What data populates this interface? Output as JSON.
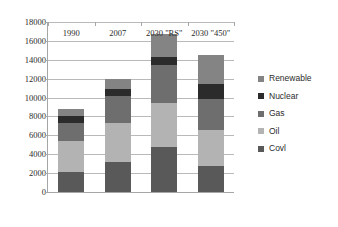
{
  "chart_data": {
    "type": "bar",
    "stacked": true,
    "title": "",
    "xlabel": "",
    "ylabel": "",
    "ylim": [
      0,
      18000
    ],
    "ytick_step": 2000,
    "yticks": [
      0,
      2000,
      4000,
      6000,
      8000,
      10000,
      12000,
      14000,
      16000,
      18000
    ],
    "grid": true,
    "legend_position": "right",
    "categories": [
      "1990",
      "2007",
      "2030 \"RS\"",
      "2030 \"450\""
    ],
    "series": [
      {
        "name": "Covl",
        "color": "#595959",
        "values": [
          2150,
          3200,
          4750,
          2800
        ]
      },
      {
        "name": "Oil",
        "color": "#b3b3b3",
        "values": [
          3300,
          4100,
          4700,
          3800
        ]
      },
      {
        "name": "Gas",
        "color": "#6e6e6e",
        "values": [
          1900,
          2900,
          4000,
          3200
        ]
      },
      {
        "name": "Nuclear",
        "color": "#2b2b2b",
        "values": [
          700,
          700,
          900,
          1600
        ]
      },
      {
        "name": "Renewable",
        "color": "#848484",
        "values": [
          700,
          1100,
          2400,
          3100
        ]
      }
    ],
    "totals": [
      8750,
      12000,
      16750,
      14500
    ],
    "legend_order": [
      "Renewable",
      "Nuclear",
      "Gas",
      "Oil",
      "Covl"
    ]
  },
  "style": {
    "axis_color": "#a6a6a6",
    "gridline_color": "#b9b9b9",
    "text_color": "#2b2b2b",
    "background": "#ffffff"
  }
}
